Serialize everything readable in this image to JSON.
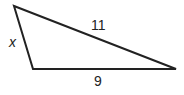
{
  "diagram": {
    "type": "triangle",
    "vertices": {
      "top_left": [
        14,
        6
      ],
      "bottom_left": [
        33,
        69
      ],
      "right": [
        176,
        69
      ]
    },
    "sides": {
      "left": {
        "label": "x"
      },
      "hypotenuse": {
        "label": "11"
      },
      "bottom": {
        "label": "9"
      }
    },
    "stroke_color": "#222222"
  }
}
